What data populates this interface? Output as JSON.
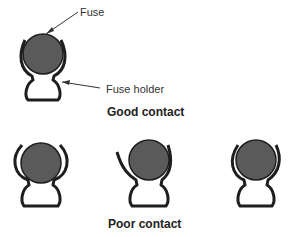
{
  "labels": {
    "fuse": "Fuse",
    "fuse_holder": "Fuse holder",
    "good_contact": "Good contact",
    "poor_contact": "Poor contact"
  },
  "colors": {
    "fuse_fill": "#5a5a5a",
    "holder_stroke": "#1e1e1e",
    "leader_line": "#333333"
  }
}
